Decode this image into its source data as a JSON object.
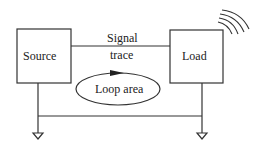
{
  "diagram": {
    "source": {
      "label": "Source"
    },
    "load": {
      "label": "Load"
    },
    "signal_trace": {
      "line1": "Signal",
      "line2": "trace"
    },
    "loop": {
      "label": "Loop area"
    },
    "icons": {
      "radiation": "radiation-waves-icon",
      "ground_left": "ground-icon",
      "ground_right": "ground-icon",
      "loop_arrow": "arrow-right-icon"
    },
    "colors": {
      "line": "#333333",
      "background": "#ffffff"
    }
  }
}
